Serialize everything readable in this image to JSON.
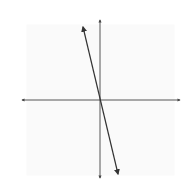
{
  "chart_data": {
    "type": "line",
    "title": "",
    "xlabel": "x",
    "ylabel": "y",
    "xlim": [
      -5,
      5
    ],
    "ylim": [
      -5,
      5
    ],
    "grid": true,
    "x_ticks": [
      -4,
      -2,
      0,
      2,
      4
    ],
    "y_ticks": [
      4,
      2,
      0,
      -2,
      -4
    ],
    "x_tick_labels": [
      "−4",
      "−2",
      "0",
      "2",
      "4"
    ],
    "y_tick_labels": [
      "4",
      "2",
      "0",
      "−2",
      "−4"
    ],
    "series": [
      {
        "name": "f",
        "label": "f",
        "kind": "linear",
        "description": "Straight line through origin with slope approx -4, arrows at both ends",
        "x": [
          -1.15,
          0,
          1.2
        ],
        "y": [
          4.9,
          0,
          -4.9
        ],
        "color": "#333333"
      },
      {
        "name": "g",
        "label": "g",
        "kind": "sigmoid",
        "description": "S-shaped increasing curve through origin, horizontal asymptotes near y=2 and y=-2, arrows at both ends",
        "x": [
          -4.8,
          -4,
          -3,
          -2,
          -1,
          0,
          1,
          2,
          3,
          4,
          4.7
        ],
        "y": [
          -1.65,
          -1.55,
          -1.4,
          -1.1,
          -0.6,
          0,
          0.6,
          1.1,
          1.4,
          1.7,
          1.85
        ],
        "color": "#888888"
      }
    ],
    "legend": "inline labels (f near upper-left of line, g to the right of origin)"
  },
  "labels": {
    "x_axis": "x",
    "y_axis": "y",
    "f": "f",
    "g": "g",
    "xt": [
      "−4",
      "−2",
      "0",
      "2",
      "4"
    ],
    "yt": [
      "4",
      "2",
      "0",
      "−2",
      "−4"
    ]
  },
  "colors": {
    "grid_major": "#d8d8d8",
    "grid_minor": "#ececec",
    "axis": "#444444",
    "f": "#333333",
    "g": "#888888"
  }
}
